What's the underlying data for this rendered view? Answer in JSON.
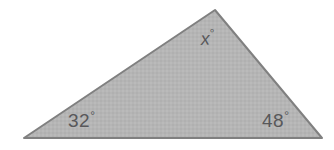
{
  "figure": {
    "type": "triangle-diagram",
    "background_color": "#ffffff",
    "shape": {
      "name": "triangle",
      "fill_color": "#b3b3b3",
      "stroke_color": "#808080",
      "stroke_width": 2,
      "vertices": [
        {
          "name": "apex",
          "x": 215,
          "y": 10
        },
        {
          "name": "bottom-right",
          "x": 322,
          "y": 138
        },
        {
          "name": "bottom-left",
          "x": 24,
          "y": 138
        }
      ]
    },
    "labels": {
      "apex": {
        "value": "x",
        "degree_symbol": "°",
        "text_color": "#58585a"
      },
      "bottom_left": {
        "value": "32",
        "degree_symbol": "°",
        "text_color": "#58585a"
      },
      "bottom_right": {
        "value": "48",
        "degree_symbol": "°",
        "text_color": "#58585a"
      }
    }
  }
}
